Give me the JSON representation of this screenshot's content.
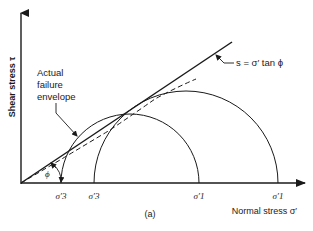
{
  "labels": {
    "y_axis": "Shear stress τ",
    "x_axis": "Normal stress σ′",
    "actual_envelope": [
      "Actual",
      "failure",
      "envelope"
    ],
    "line_eq": "s = σ′ tan ϕ",
    "phi": "ϕ",
    "sigma3_a": "σ′3",
    "sigma3_b": "σ′3",
    "sigma1_a": "σ′1",
    "sigma1_b": "σ′1",
    "caption": "(a)"
  },
  "colors": {
    "ink": "#1a1a1a",
    "background": "#ffffff"
  },
  "mohr_circles": [
    {
      "name": "small-circle",
      "sigma3_label": "σ′3",
      "sigma1_label": "σ′1"
    },
    {
      "name": "large-circle",
      "sigma3_label": "σ′3",
      "sigma1_label": "σ′1"
    }
  ]
}
